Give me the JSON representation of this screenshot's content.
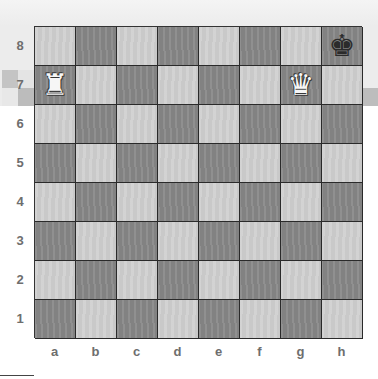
{
  "diagram": {
    "type": "chess-position",
    "board": {
      "files": [
        "a",
        "b",
        "c",
        "d",
        "e",
        "f",
        "g",
        "h"
      ],
      "ranks": [
        "8",
        "7",
        "6",
        "5",
        "4",
        "3",
        "2",
        "1"
      ],
      "light_color": "#cfcfcf",
      "dark_color": "#8a8a8a"
    },
    "pieces": [
      {
        "square": "a7",
        "color": "white",
        "type": "rook",
        "glyph": "♜"
      },
      {
        "square": "g7",
        "color": "white",
        "type": "queen",
        "glyph": "♛"
      },
      {
        "square": "h8",
        "color": "black",
        "type": "king",
        "glyph": "♚"
      }
    ]
  }
}
